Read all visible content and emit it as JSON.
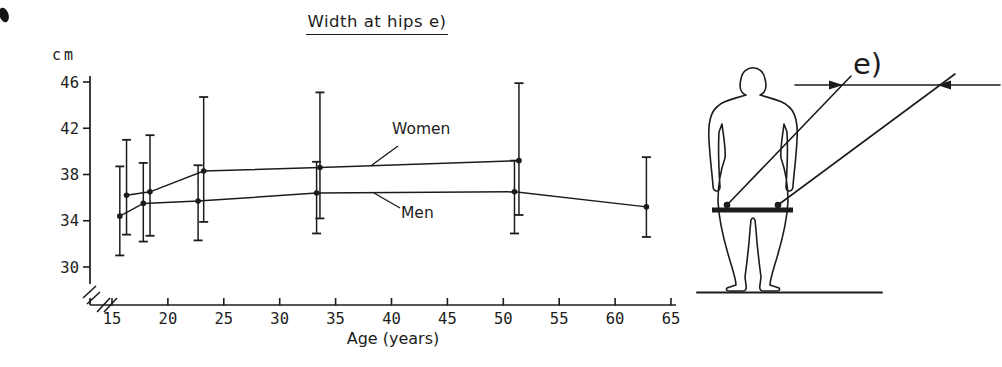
{
  "chart_data": {
    "type": "line",
    "title": "Width at hips e)",
    "xlabel": "Age (years)",
    "ylabel": "cm",
    "xlim": [
      13,
      66
    ],
    "ylim": [
      28,
      47
    ],
    "x_ticks": [
      15,
      20,
      25,
      30,
      35,
      40,
      45,
      50,
      55,
      60,
      65
    ],
    "y_ticks": [
      46,
      42,
      38,
      34,
      30
    ],
    "axis_break": true,
    "error_bars": true,
    "legend_position": "inline-annotations",
    "grid": false,
    "series": [
      {
        "name": "Women",
        "points": [
          {
            "age": 16.3,
            "mean": 36.2,
            "lo": 32.8,
            "hi": 41.0
          },
          {
            "age": 18.4,
            "mean": 36.5,
            "lo": 32.7,
            "hi": 41.4
          },
          {
            "age": 23.2,
            "mean": 38.3,
            "lo": 33.9,
            "hi": 44.7
          },
          {
            "age": 33.6,
            "mean": 38.6,
            "lo": 34.2,
            "hi": 45.1
          },
          {
            "age": 51.4,
            "mean": 39.2,
            "lo": 34.5,
            "hi": 45.9
          }
        ]
      },
      {
        "name": "Men",
        "points": [
          {
            "age": 15.7,
            "mean": 34.4,
            "lo": 31.0,
            "hi": 38.7
          },
          {
            "age": 17.8,
            "mean": 35.5,
            "lo": 32.2,
            "hi": 39.0
          },
          {
            "age": 22.7,
            "mean": 35.7,
            "lo": 32.3,
            "hi": 38.8
          },
          {
            "age": 33.3,
            "mean": 36.4,
            "lo": 32.9,
            "hi": 39.1
          },
          {
            "age": 51.0,
            "mean": 36.5,
            "lo": 32.9,
            "hi": 39.2
          },
          {
            "age": 62.8,
            "mean": 35.2,
            "lo": 32.6,
            "hi": 39.5
          }
        ]
      }
    ]
  },
  "figure": {
    "label": "e)"
  },
  "colors": {
    "ink": "#1c1c1c",
    "paper": "#ffffff"
  }
}
